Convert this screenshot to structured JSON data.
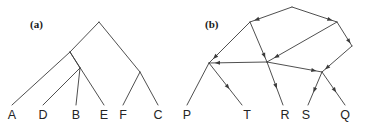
{
  "figure": {
    "width": 366,
    "height": 129,
    "background": "#ffffff",
    "ink_color": "#3b3b3b",
    "text_color": "#242424"
  },
  "panels": [
    {
      "id": "panel-a",
      "label": "(a)",
      "label_x": 30,
      "label_y": 28,
      "type": "rooted-tree",
      "description": "Undirected rooted phylogenetic tree with six leaves",
      "leaves": [
        {
          "name": "A",
          "x": 12,
          "y": 119,
          "tip_x": 12,
          "tip_y": 105
        },
        {
          "name": "D",
          "x": 43,
          "y": 119,
          "tip_x": 43,
          "tip_y": 105
        },
        {
          "name": "B",
          "x": 76,
          "y": 119,
          "tip_x": 76,
          "tip_y": 105
        },
        {
          "name": "E",
          "x": 104,
          "y": 119,
          "tip_x": 104,
          "tip_y": 105
        },
        {
          "name": "F",
          "x": 123,
          "y": 119,
          "tip_x": 123,
          "tip_y": 105
        },
        {
          "name": "C",
          "x": 158,
          "y": 119,
          "tip_x": 158,
          "tip_y": 105
        }
      ],
      "nodes": [
        {
          "id": "root",
          "x": 99,
          "y": 22
        },
        {
          "id": "n1",
          "x": 70,
          "y": 52
        },
        {
          "id": "n2",
          "x": 80,
          "y": 68
        },
        {
          "id": "n3",
          "x": 140,
          "y": 72
        }
      ],
      "edges": [
        {
          "from": "root",
          "to": "n1"
        },
        {
          "from": "root",
          "to": "n3"
        },
        {
          "from": "n1",
          "to": "A"
        },
        {
          "from": "n1",
          "to": "n2"
        },
        {
          "from": "n2",
          "to": "D"
        },
        {
          "from": "n2",
          "to": "B"
        },
        {
          "from": "n1",
          "to": "E"
        },
        {
          "from": "n3",
          "to": "F"
        },
        {
          "from": "n3",
          "to": "C"
        }
      ]
    },
    {
      "id": "panel-b",
      "label": "(b)",
      "label_x": 205,
      "label_y": 28,
      "type": "directed-graph",
      "description": "Directed acyclic graph (reticulate network) with arrowheads, five terminal taxa",
      "leaves": [
        {
          "name": "P",
          "x": 187,
          "y": 119,
          "tip_x": 187,
          "tip_y": 105
        },
        {
          "name": "T",
          "x": 247,
          "y": 119,
          "tip_x": 242,
          "tip_y": 105
        },
        {
          "name": "R",
          "x": 285,
          "y": 119,
          "tip_x": 283,
          "tip_y": 105
        },
        {
          "name": "S",
          "x": 306,
          "y": 119,
          "tip_x": 308,
          "tip_y": 105
        },
        {
          "name": "Q",
          "x": 345,
          "y": 119,
          "tip_x": 345,
          "tip_y": 105
        }
      ],
      "nodes": [
        {
          "id": "top",
          "x": 292,
          "y": 7
        },
        {
          "id": "ul",
          "x": 250,
          "y": 22
        },
        {
          "id": "ur",
          "x": 337,
          "y": 22
        },
        {
          "id": "rr",
          "x": 352,
          "y": 46
        },
        {
          "id": "ml",
          "x": 209,
          "y": 63
        },
        {
          "id": "mc",
          "x": 267,
          "y": 62
        },
        {
          "id": "mr",
          "x": 322,
          "y": 72
        }
      ],
      "edges": [
        {
          "from": "top",
          "to": "ul",
          "arrow": true
        },
        {
          "from": "top",
          "to": "ur",
          "arrow": true
        },
        {
          "from": "ul",
          "to": "ml",
          "arrow": true
        },
        {
          "from": "ul",
          "to": "mc",
          "arrow": true
        },
        {
          "from": "ur",
          "to": "mc",
          "arrow": true
        },
        {
          "from": "ur",
          "to": "rr",
          "arrow": true
        },
        {
          "from": "rr",
          "to": "mr",
          "arrow": true
        },
        {
          "from": "mc",
          "to": "ml",
          "arrow": true
        },
        {
          "from": "mc",
          "to": "mr",
          "arrow": true
        },
        {
          "from": "ml",
          "to": "P",
          "arrow": false
        },
        {
          "from": "ml",
          "to": "T",
          "arrow": true
        },
        {
          "from": "mc",
          "to": "R",
          "arrow": true
        },
        {
          "from": "mr",
          "to": "S",
          "arrow": true
        },
        {
          "from": "mr",
          "to": "Q",
          "arrow": true
        }
      ]
    }
  ]
}
